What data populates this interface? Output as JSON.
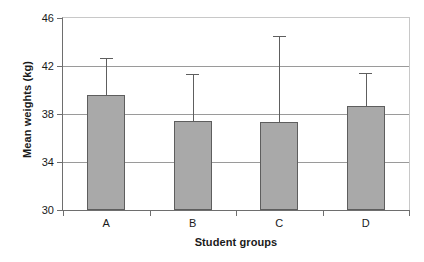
{
  "chart_data": {
    "type": "bar",
    "title": "",
    "subtitle": "",
    "xlabel": "Student groups",
    "ylabel": "Mean weights (kg)",
    "categories": [
      "A",
      "B",
      "C",
      "D"
    ],
    "values": [
      39.6,
      37.4,
      37.3,
      38.7
    ],
    "error_upper": [
      42.7,
      41.3,
      44.5,
      41.4
    ],
    "error_bars": [
      3.1,
      3.9,
      7.2,
      2.7
    ],
    "series": [
      {
        "name": "Mean weight",
        "values": [
          39.6,
          37.4,
          37.3,
          38.7
        ]
      }
    ],
    "ylim": [
      30,
      46
    ],
    "xlim": [
      0,
      4
    ],
    "yticks": [
      30,
      34,
      38,
      42,
      46
    ],
    "ytick_labels": [
      "30",
      "34",
      "38",
      "42",
      "46"
    ],
    "grid": true,
    "grid_axis": "y",
    "legend": false,
    "legend_position": "none",
    "bar_color": "#a9a9a9",
    "bar_edge_color": "#5e5e5e",
    "error_color": "#5e5e5e",
    "axis_color": "#6e6e6e",
    "grid_color": "#9a9a9a",
    "background": "#ffffff",
    "error_bar_style": "upper-only-with-cap",
    "annotations": []
  }
}
